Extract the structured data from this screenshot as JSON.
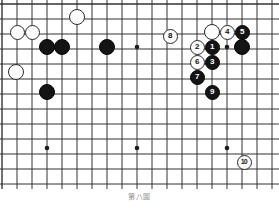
{
  "figure": {
    "caption": "第八圖",
    "board_width": 279,
    "board_height": 189
  },
  "board": {
    "line_color": "#333333",
    "background_color": "#ffffff",
    "cols": 18,
    "rows": 12,
    "x_origin": 2,
    "y_origin": 4,
    "spacing": 15,
    "star_points": [
      {
        "x": 47,
        "y": 47
      },
      {
        "x": 137,
        "y": 47
      },
      {
        "x": 227,
        "y": 47
      },
      {
        "x": 47,
        "y": 148
      },
      {
        "x": 137,
        "y": 148
      },
      {
        "x": 227,
        "y": 148
      }
    ]
  },
  "colors": {
    "black_stone": "#141414",
    "white_stone": "#fdfdfd",
    "stone_outline": "#2a2a2a",
    "black_label": "#ffffff",
    "white_label": "#111111",
    "caption": "#8d8d8d"
  },
  "stones": [
    {
      "id": "w-a",
      "color": "white",
      "label": "",
      "x": 17,
      "y": 32,
      "r": 7.5
    },
    {
      "id": "w-b",
      "color": "white",
      "label": "",
      "x": 32,
      "y": 32,
      "r": 7.5
    },
    {
      "id": "w-c",
      "color": "white",
      "label": "",
      "x": 77,
      "y": 17,
      "r": 8
    },
    {
      "id": "w-d",
      "color": "white",
      "label": "",
      "x": 16,
      "y": 72,
      "r": 8
    },
    {
      "id": "b-a",
      "color": "black",
      "label": "",
      "x": 47,
      "y": 47,
      "r": 8
    },
    {
      "id": "b-b",
      "color": "black",
      "label": "",
      "x": 62,
      "y": 47,
      "r": 8
    },
    {
      "id": "b-c",
      "color": "black",
      "label": "",
      "x": 107,
      "y": 47,
      "r": 8
    },
    {
      "id": "b-d",
      "color": "black",
      "label": "",
      "x": 47,
      "y": 92,
      "r": 8
    },
    {
      "id": "w-e",
      "color": "white",
      "label": "",
      "x": 212,
      "y": 32,
      "r": 8
    },
    {
      "id": "b-e",
      "color": "black",
      "label": "",
      "x": 242,
      "y": 47,
      "r": 8
    },
    {
      "id": "m-8",
      "color": "white",
      "label": "8",
      "x": 170,
      "y": 36,
      "r": 7.5
    },
    {
      "id": "m-4",
      "color": "white",
      "label": "4",
      "x": 227,
      "y": 32,
      "r": 7.5
    },
    {
      "id": "m-5",
      "color": "black",
      "label": "5",
      "x": 242,
      "y": 32,
      "r": 7.5
    },
    {
      "id": "m-2",
      "color": "white",
      "label": "2",
      "x": 197,
      "y": 47,
      "r": 7.5
    },
    {
      "id": "m-1",
      "color": "black",
      "label": "1",
      "x": 212,
      "y": 47,
      "r": 7.5
    },
    {
      "id": "m-6",
      "color": "white",
      "label": "6",
      "x": 197,
      "y": 62,
      "r": 7.5
    },
    {
      "id": "m-3",
      "color": "black",
      "label": "3",
      "x": 212,
      "y": 62,
      "r": 7.5
    },
    {
      "id": "m-7",
      "color": "black",
      "label": "7",
      "x": 197,
      "y": 77,
      "r": 7.5
    },
    {
      "id": "m-9",
      "color": "black",
      "label": "9",
      "x": 212,
      "y": 92,
      "r": 7.5
    },
    {
      "id": "m-10",
      "color": "white",
      "label": "10",
      "x": 244,
      "y": 162,
      "r": 7.5
    }
  ]
}
